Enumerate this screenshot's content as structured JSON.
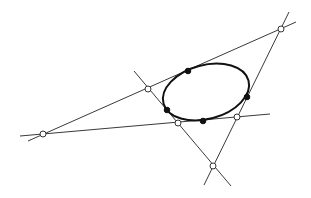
{
  "diagram": {
    "type": "complete-quadrilateral-with-inscribed-ellipse",
    "canvas": {
      "width": 311,
      "height": 198,
      "background": "#ffffff"
    },
    "colors": {
      "line": "#3a3a3a",
      "ellipse": "#111111",
      "filled_point": "#111111",
      "open_point_fill": "#ffffff"
    },
    "ellipse": {
      "cx": 206,
      "cy": 92,
      "rx": 44,
      "ry": 27,
      "rotation_deg": -15
    },
    "lines": [
      {
        "id": "top-line",
        "x1": 28,
        "y1": 141,
        "x2": 296,
        "y2": 22
      },
      {
        "id": "bottom-line",
        "x1": 20,
        "y1": 136,
        "x2": 270,
        "y2": 114
      },
      {
        "id": "left-diagonal",
        "x1": 134,
        "y1": 71,
        "x2": 231,
        "y2": 186
      },
      {
        "id": "right-diagonal",
        "x1": 289,
        "y1": 12,
        "x2": 204,
        "y2": 185
      }
    ],
    "intersection_points": [
      {
        "id": "far-left",
        "x": 43,
        "y": 134
      },
      {
        "id": "top-right",
        "x": 281,
        "y": 29
      },
      {
        "id": "upper-left",
        "x": 148,
        "y": 89
      },
      {
        "id": "lower-middle",
        "x": 178,
        "y": 123
      },
      {
        "id": "lower-right",
        "x": 237,
        "y": 117
      },
      {
        "id": "bottom",
        "x": 213,
        "y": 166
      }
    ],
    "tangent_points": [
      {
        "id": "tangent-top",
        "x": 188,
        "y": 71
      },
      {
        "id": "tangent-right",
        "x": 247,
        "y": 97
      },
      {
        "id": "tangent-left",
        "x": 167,
        "y": 110
      },
      {
        "id": "tangent-bottom",
        "x": 203,
        "y": 121
      }
    ]
  }
}
